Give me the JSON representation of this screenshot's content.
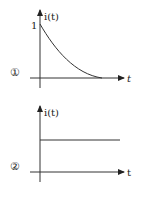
{
  "diagram": {
    "plot1": {
      "id_label": "①",
      "y_axis_label": "i(t)",
      "x_axis_label": "t",
      "y_tick_label": "1",
      "curve": "exponential-decay"
    },
    "plot2": {
      "id_label": "②",
      "y_axis_label": "i(t)",
      "x_axis_label": "t",
      "curve": "constant"
    }
  },
  "colors": {
    "line": "#333333",
    "background": "#ffffff"
  }
}
